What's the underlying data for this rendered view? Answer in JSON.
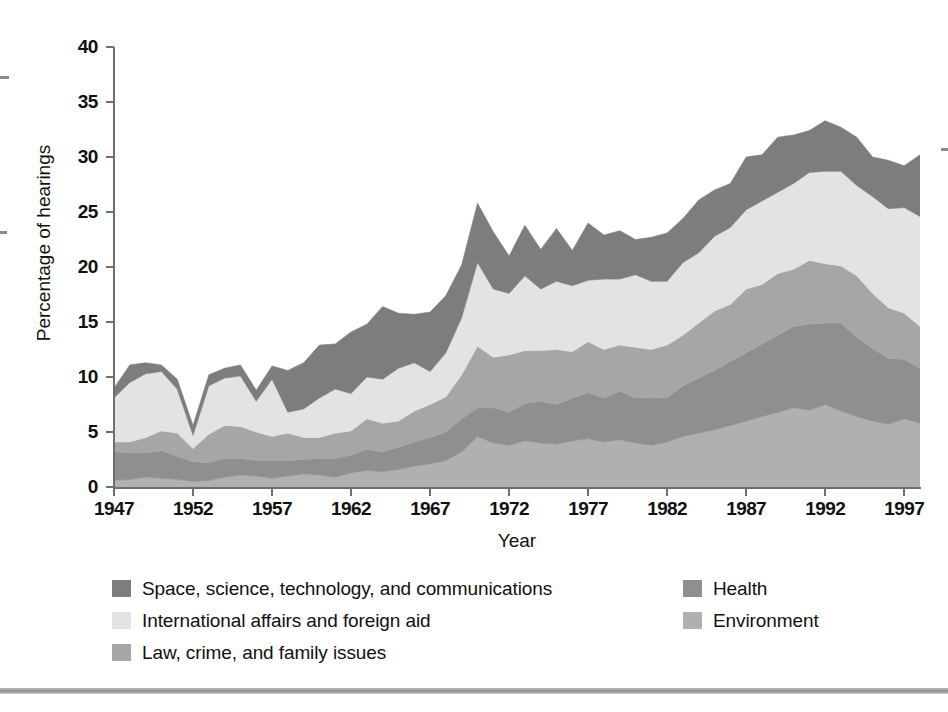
{
  "chart_data": {
    "type": "area",
    "stacked": true,
    "title": "",
    "xlabel": "Year",
    "ylabel": "Percentage of hearings",
    "xlim": [
      1947,
      1998
    ],
    "ylim": [
      0,
      40
    ],
    "ytick_labels": [
      "0",
      "5",
      "10",
      "15",
      "20",
      "25",
      "30",
      "35",
      "40"
    ],
    "ytick_values": [
      0,
      5,
      10,
      15,
      20,
      25,
      30,
      35,
      40
    ],
    "xtick_labels": [
      "1947",
      "1952",
      "1957",
      "1962",
      "1967",
      "1972",
      "1977",
      "1982",
      "1987",
      "1992",
      "1997"
    ],
    "xtick_values": [
      1947,
      1952,
      1957,
      1962,
      1967,
      1972,
      1977,
      1982,
      1987,
      1992,
      1997
    ],
    "grid": false,
    "legend_position": "bottom",
    "x": [
      1947,
      1948,
      1949,
      1950,
      1951,
      1952,
      1953,
      1954,
      1955,
      1956,
      1957,
      1958,
      1959,
      1960,
      1961,
      1962,
      1963,
      1964,
      1965,
      1966,
      1967,
      1968,
      1969,
      1970,
      1971,
      1972,
      1973,
      1974,
      1975,
      1976,
      1977,
      1978,
      1979,
      1980,
      1981,
      1982,
      1983,
      1984,
      1985,
      1986,
      1987,
      1988,
      1989,
      1990,
      1991,
      1992,
      1993,
      1994,
      1995,
      1996,
      1997,
      1998
    ],
    "series": [
      {
        "name": "Environment",
        "color": "#b0b0b0",
        "stack_order": 1,
        "values": [
          0.6,
          0.7,
          0.9,
          0.8,
          0.7,
          0.5,
          0.6,
          0.9,
          1.1,
          1.0,
          0.8,
          1.0,
          1.2,
          1.1,
          0.9,
          1.3,
          1.5,
          1.4,
          1.6,
          1.9,
          2.1,
          2.4,
          3.2,
          4.6,
          4.0,
          3.8,
          4.2,
          4.0,
          3.9,
          4.2,
          4.4,
          4.1,
          4.3,
          4.0,
          3.8,
          4.1,
          4.6,
          4.9,
          5.2,
          5.6,
          6.0,
          6.4,
          6.8,
          7.2,
          7.0,
          7.5,
          6.9,
          6.4,
          6.0,
          5.7,
          6.2,
          5.8
        ]
      },
      {
        "name": "Health",
        "color": "#8f8f8f",
        "stack_order": 2,
        "values": [
          2.6,
          2.4,
          2.2,
          2.5,
          2.1,
          1.8,
          1.6,
          1.7,
          1.5,
          1.4,
          1.6,
          1.4,
          1.3,
          1.5,
          1.7,
          1.6,
          1.9,
          1.8,
          2.0,
          2.2,
          2.4,
          2.6,
          3.0,
          2.6,
          3.2,
          3.0,
          3.4,
          3.8,
          3.6,
          3.9,
          4.2,
          4.0,
          4.4,
          4.1,
          4.3,
          4.0,
          4.6,
          5.0,
          5.4,
          5.8,
          6.2,
          6.6,
          7.0,
          7.4,
          7.8,
          7.4,
          8.0,
          7.2,
          6.6,
          6.0,
          5.4,
          5.0
        ]
      },
      {
        "name": "Law, crime, and family issues",
        "color": "#a6a6a6",
        "stack_order": 3,
        "values": [
          0.9,
          1.0,
          1.4,
          1.8,
          2.1,
          1.2,
          2.6,
          3.0,
          2.9,
          2.6,
          2.2,
          2.5,
          2.0,
          1.9,
          2.3,
          2.2,
          2.8,
          2.6,
          2.4,
          2.8,
          3.0,
          3.2,
          4.0,
          5.6,
          4.6,
          5.2,
          4.8,
          4.6,
          5.0,
          4.2,
          4.6,
          4.4,
          4.2,
          4.6,
          4.4,
          4.8,
          4.6,
          5.0,
          5.4,
          5.2,
          5.8,
          5.4,
          5.6,
          5.2,
          5.8,
          5.4,
          5.2,
          5.6,
          5.0,
          4.6,
          4.2,
          3.8
        ]
      },
      {
        "name": "International affairs and foreign aid",
        "color": "#e3e3e3",
        "stack_order": 4,
        "values": [
          4.0,
          5.4,
          5.8,
          5.4,
          4.0,
          1.2,
          4.4,
          4.3,
          4.6,
          2.8,
          5.2,
          1.9,
          2.6,
          3.6,
          4.0,
          3.4,
          3.8,
          4.0,
          4.8,
          4.4,
          3.0,
          4.0,
          5.2,
          7.6,
          6.2,
          5.6,
          6.8,
          5.6,
          6.2,
          6.0,
          5.6,
          6.4,
          6.0,
          6.6,
          6.2,
          5.8,
          6.6,
          6.4,
          6.8,
          7.0,
          7.2,
          7.6,
          7.4,
          7.8,
          8.0,
          8.4,
          8.6,
          8.2,
          8.8,
          9.0,
          9.6,
          10.0
        ]
      },
      {
        "name": "Space, science, technology, and communications",
        "color": "#7d7d7d",
        "stack_order": 5,
        "values": [
          0.9,
          1.6,
          1.0,
          0.6,
          0.9,
          0.9,
          1.0,
          0.9,
          1.0,
          1.0,
          1.2,
          3.8,
          4.2,
          4.8,
          4.1,
          5.6,
          4.8,
          6.6,
          5.0,
          4.4,
          5.4,
          5.2,
          4.8,
          5.4,
          5.2,
          3.4,
          4.6,
          3.6,
          4.8,
          3.2,
          5.2,
          4.0,
          4.4,
          3.2,
          4.0,
          4.4,
          4.0,
          4.8,
          4.2,
          4.0,
          4.8,
          4.2,
          5.0,
          4.4,
          3.8,
          4.6,
          4.0,
          4.4,
          3.6,
          4.4,
          3.8,
          5.6
        ]
      }
    ]
  },
  "axes": {
    "y_title": "Percentage of hearings",
    "x_title": "Year"
  },
  "legend": {
    "left_column": [
      {
        "label": "Space, science, technology, and communications",
        "color": "#7d7d7d"
      },
      {
        "label": "International affairs and foreign aid",
        "color": "#e3e3e3"
      },
      {
        "label": "Law, crime, and family issues",
        "color": "#a6a6a6"
      }
    ],
    "right_column": [
      {
        "label": "Health",
        "color": "#8f8f8f"
      },
      {
        "label": "Environment",
        "color": "#b0b0b0"
      }
    ]
  }
}
